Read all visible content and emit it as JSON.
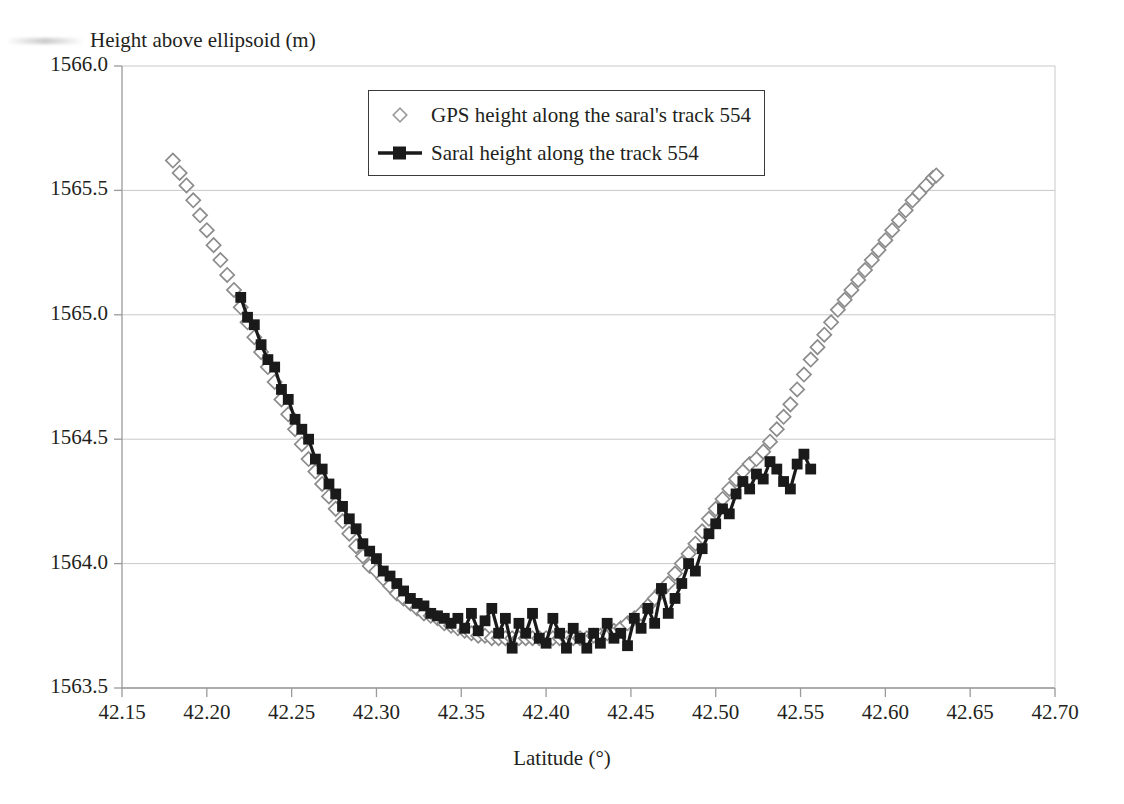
{
  "chart_data": {
    "type": "scatter",
    "title": "",
    "ylabel": "Height above ellipsoid (m)",
    "xlabel": "Latitude (°)",
    "xlim": [
      42.15,
      42.7
    ],
    "ylim": [
      1563.5,
      1566.0
    ],
    "xticks": [
      "42.15",
      "42.20",
      "42.25",
      "42.30",
      "42.35",
      "42.40",
      "42.45",
      "42.50",
      "42.55",
      "42.60",
      "42.65",
      "42.70"
    ],
    "xtick_values": [
      42.15,
      42.2,
      42.25,
      42.3,
      42.35,
      42.4,
      42.45,
      42.5,
      42.55,
      42.6,
      42.65,
      42.7
    ],
    "yticks": [
      "1563.5",
      "1564.0",
      "1564.5",
      "1565.0",
      "1565.5",
      "1566.0"
    ],
    "ytick_values": [
      1563.5,
      1564.0,
      1564.5,
      1565.0,
      1565.5,
      1566.0
    ],
    "grid": "horizontal",
    "legend_position": "top-center",
    "series": [
      {
        "name": "GPS height along the saral's track 554",
        "marker": "diamond-outline",
        "color": "#8c8c8c",
        "style": "markers",
        "x": [
          42.18,
          42.184,
          42.188,
          42.192,
          42.196,
          42.2,
          42.204,
          42.208,
          42.212,
          42.216,
          42.22,
          42.224,
          42.228,
          42.232,
          42.236,
          42.24,
          42.244,
          42.248,
          42.252,
          42.256,
          42.26,
          42.264,
          42.268,
          42.272,
          42.276,
          42.28,
          42.284,
          42.288,
          42.292,
          42.296,
          42.3,
          42.304,
          42.308,
          42.312,
          42.316,
          42.32,
          42.324,
          42.328,
          42.332,
          42.336,
          42.34,
          42.344,
          42.348,
          42.352,
          42.356,
          42.36,
          42.364,
          42.368,
          42.372,
          42.376,
          42.38,
          42.384,
          42.388,
          42.392,
          42.396,
          42.4,
          42.404,
          42.408,
          42.412,
          42.416,
          42.42,
          42.424,
          42.428,
          42.432,
          42.436,
          42.44,
          42.444,
          42.448,
          42.452,
          42.456,
          42.46,
          42.464,
          42.468,
          42.472,
          42.476,
          42.48,
          42.484,
          42.488,
          42.492,
          42.496,
          42.5,
          42.504,
          42.508,
          42.512,
          42.516,
          42.52,
          42.524,
          42.528,
          42.532,
          42.536,
          42.54,
          42.544,
          42.548,
          42.552,
          42.556,
          42.56,
          42.564,
          42.568,
          42.572,
          42.576,
          42.58,
          42.584,
          42.588,
          42.592,
          42.596,
          42.6,
          42.604,
          42.608,
          42.612,
          42.616,
          42.62,
          42.624,
          42.628,
          42.63
        ],
        "y": [
          1565.62,
          1565.57,
          1565.52,
          1565.46,
          1565.4,
          1565.34,
          1565.28,
          1565.22,
          1565.16,
          1565.1,
          1565.03,
          1564.97,
          1564.91,
          1564.85,
          1564.79,
          1564.73,
          1564.66,
          1564.6,
          1564.54,
          1564.48,
          1564.42,
          1564.37,
          1564.32,
          1564.27,
          1564.22,
          1564.17,
          1564.12,
          1564.07,
          1564.03,
          1563.99,
          1563.97,
          1563.94,
          1563.91,
          1563.88,
          1563.86,
          1563.84,
          1563.82,
          1563.8,
          1563.79,
          1563.78,
          1563.76,
          1563.75,
          1563.74,
          1563.73,
          1563.72,
          1563.71,
          1563.71,
          1563.7,
          1563.7,
          1563.7,
          1563.7,
          1563.7,
          1563.7,
          1563.7,
          1563.7,
          1563.7,
          1563.7,
          1563.7,
          1563.7,
          1563.7,
          1563.7,
          1563.7,
          1563.71,
          1563.71,
          1563.72,
          1563.73,
          1563.74,
          1563.76,
          1563.78,
          1563.8,
          1563.83,
          1563.86,
          1563.89,
          1563.92,
          1563.96,
          1564.0,
          1564.04,
          1564.08,
          1564.13,
          1564.18,
          1564.22,
          1564.26,
          1564.3,
          1564.34,
          1564.37,
          1564.4,
          1564.42,
          1564.45,
          1564.49,
          1564.54,
          1564.59,
          1564.64,
          1564.7,
          1564.76,
          1564.82,
          1564.87,
          1564.92,
          1564.97,
          1565.02,
          1565.06,
          1565.1,
          1565.14,
          1565.18,
          1565.22,
          1565.26,
          1565.3,
          1565.34,
          1565.38,
          1565.42,
          1565.46,
          1565.49,
          1565.52,
          1565.55,
          1565.56
        ]
      },
      {
        "name": "Saral height along the track 554",
        "marker": "square-filled",
        "color": "#1a1a1a",
        "style": "line+markers",
        "x": [
          42.22,
          42.224,
          42.228,
          42.232,
          42.236,
          42.24,
          42.244,
          42.248,
          42.252,
          42.256,
          42.26,
          42.264,
          42.268,
          42.272,
          42.276,
          42.28,
          42.284,
          42.288,
          42.292,
          42.296,
          42.3,
          42.304,
          42.308,
          42.312,
          42.316,
          42.32,
          42.324,
          42.328,
          42.332,
          42.336,
          42.34,
          42.344,
          42.348,
          42.352,
          42.356,
          42.36,
          42.364,
          42.368,
          42.372,
          42.376,
          42.38,
          42.384,
          42.388,
          42.392,
          42.396,
          42.4,
          42.404,
          42.408,
          42.412,
          42.416,
          42.42,
          42.424,
          42.428,
          42.432,
          42.436,
          42.44,
          42.444,
          42.448,
          42.452,
          42.456,
          42.46,
          42.464,
          42.468,
          42.472,
          42.476,
          42.48,
          42.484,
          42.488,
          42.492,
          42.496,
          42.5,
          42.504,
          42.508,
          42.512,
          42.516,
          42.52,
          42.524,
          42.528,
          42.532,
          42.536,
          42.54,
          42.544,
          42.548,
          42.552,
          42.556
        ],
        "y": [
          1565.07,
          1564.99,
          1564.96,
          1564.88,
          1564.82,
          1564.79,
          1564.7,
          1564.66,
          1564.58,
          1564.54,
          1564.5,
          1564.42,
          1564.38,
          1564.32,
          1564.28,
          1564.23,
          1564.18,
          1564.14,
          1564.08,
          1564.05,
          1564.02,
          1563.97,
          1563.95,
          1563.92,
          1563.89,
          1563.86,
          1563.84,
          1563.83,
          1563.8,
          1563.79,
          1563.78,
          1563.76,
          1563.78,
          1563.74,
          1563.8,
          1563.73,
          1563.77,
          1563.82,
          1563.72,
          1563.78,
          1563.66,
          1563.76,
          1563.72,
          1563.8,
          1563.7,
          1563.68,
          1563.78,
          1563.72,
          1563.66,
          1563.74,
          1563.7,
          1563.66,
          1563.72,
          1563.68,
          1563.76,
          1563.7,
          1563.72,
          1563.67,
          1563.78,
          1563.74,
          1563.82,
          1563.76,
          1563.9,
          1563.8,
          1563.86,
          1563.92,
          1564.0,
          1563.97,
          1564.06,
          1564.12,
          1564.16,
          1564.22,
          1564.2,
          1564.28,
          1564.33,
          1564.3,
          1564.36,
          1564.34,
          1564.41,
          1564.38,
          1564.33,
          1564.3,
          1564.4,
          1564.44,
          1564.38
        ]
      }
    ]
  },
  "legend": {
    "items": [
      {
        "label": "GPS height along the saral's track 554",
        "key": "diamond-outline"
      },
      {
        "label": "Saral height along the track 554",
        "key": "square-line"
      }
    ]
  },
  "colors": {
    "gps_marker": "#8c8c8c",
    "saral_marker": "#1a1a1a",
    "grid": "#c9c9c9",
    "axis": "#9a9a9a",
    "text": "#231f20"
  }
}
